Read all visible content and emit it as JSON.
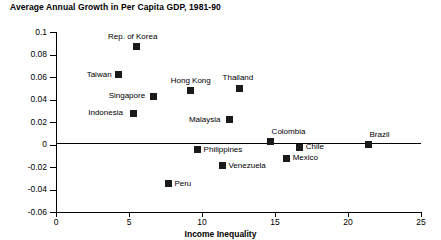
{
  "chart_data": {
    "type": "scatter",
    "title": "Average Annual Growth in Per Capita GDP, 1981-90",
    "xlabel": "Income Inequality",
    "ylabel": "",
    "xlim": [
      0,
      25
    ],
    "ylim": [
      -0.06,
      0.1
    ],
    "xticks": [
      0,
      5,
      10,
      15,
      20,
      25
    ],
    "xtick_labels": [
      "0",
      "5",
      "10",
      "15",
      "20",
      "25"
    ],
    "yticks": [
      -0.06,
      -0.04,
      -0.02,
      0,
      0.02,
      0.04,
      0.06,
      0.08,
      0.1
    ],
    "ytick_labels": [
      "-0.06",
      "-0.04",
      "-0.02",
      "0",
      "0.02",
      "0.04",
      "0.06",
      "0.08",
      "0.1"
    ],
    "grid": false,
    "legend": false,
    "zero_line": true,
    "marker_color": "#1a1a1a",
    "marker_shape": "square",
    "points": [
      {
        "label": "Rep. of Korea",
        "x": 5.5,
        "y": 0.087,
        "label_pos": "above"
      },
      {
        "label": "Taiwan",
        "x": 4.3,
        "y": 0.062,
        "label_pos": "left"
      },
      {
        "label": "Hong Kong",
        "x": 9.2,
        "y": 0.048,
        "label_pos": "above"
      },
      {
        "label": "Thailand",
        "x": 12.6,
        "y": 0.05,
        "label_pos": "above"
      },
      {
        "label": "Singapore",
        "x": 6.7,
        "y": 0.043,
        "label_pos": "left"
      },
      {
        "label": "Indonesia",
        "x": 5.3,
        "y": 0.028,
        "label_pos": "left"
      },
      {
        "label": "Malaysia",
        "x": 11.9,
        "y": 0.022,
        "label_pos": "left"
      },
      {
        "label": "Colombia",
        "x": 14.7,
        "y": 0.0025,
        "label_pos": "above-right"
      },
      {
        "label": "Chile",
        "x": 16.7,
        "y": -0.0025,
        "label_pos": "right"
      },
      {
        "label": "Brazil",
        "x": 21.4,
        "y": 0.0,
        "label_pos": "above-right"
      },
      {
        "label": "Philippines",
        "x": 9.7,
        "y": -0.0045,
        "label_pos": "right"
      },
      {
        "label": "Venezuela",
        "x": 11.4,
        "y": -0.019,
        "label_pos": "right"
      },
      {
        "label": "Mexico",
        "x": 15.8,
        "y": -0.012,
        "label_pos": "right"
      },
      {
        "label": "Peru",
        "x": 7.7,
        "y": -0.035,
        "label_pos": "right"
      }
    ]
  }
}
